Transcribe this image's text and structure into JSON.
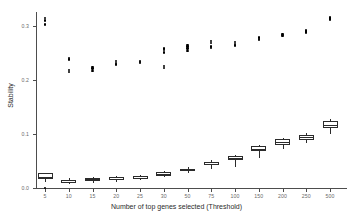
{
  "chart_data": {
    "type": "box",
    "title": "",
    "xlabel": "Number of top genes selected (Threshold)",
    "ylabel": "Stability",
    "grid": false,
    "legend": "none",
    "categories": [
      "5",
      "10",
      "15",
      "20",
      "25",
      "30",
      "50",
      "75",
      "100",
      "150",
      "200",
      "250",
      "500"
    ],
    "ylim": [
      0.0,
      0.33
    ],
    "yticks": [
      0.0,
      0.1,
      0.2,
      0.3
    ],
    "ytick_labels": [
      "0.0",
      "0.1",
      "0.2",
      "0.3"
    ],
    "series": [
      {
        "name": "lower-boxplots",
        "boxes": [
          {
            "category": "5",
            "whisker_low": 0.012,
            "q1": 0.016,
            "median": 0.021,
            "q3": 0.027,
            "whisker_high": 0.027,
            "outliers": [
              0.0
            ]
          },
          {
            "category": "10",
            "whisker_low": 0.008,
            "q1": 0.01,
            "median": 0.012,
            "q3": 0.015,
            "whisker_high": 0.018,
            "outliers": []
          },
          {
            "category": "15",
            "whisker_low": 0.01,
            "q1": 0.013,
            "median": 0.016,
            "q3": 0.019,
            "whisker_high": 0.021,
            "outliers": []
          },
          {
            "category": "20",
            "whisker_low": 0.012,
            "q1": 0.015,
            "median": 0.017,
            "q3": 0.02,
            "whisker_high": 0.022,
            "outliers": []
          },
          {
            "category": "25",
            "whisker_low": 0.014,
            "q1": 0.017,
            "median": 0.019,
            "q3": 0.023,
            "whisker_high": 0.025,
            "outliers": []
          },
          {
            "category": "30",
            "whisker_low": 0.02,
            "q1": 0.023,
            "median": 0.026,
            "q3": 0.029,
            "whisker_high": 0.031,
            "outliers": []
          },
          {
            "category": "50",
            "whisker_low": 0.028,
            "q1": 0.031,
            "median": 0.033,
            "q3": 0.036,
            "whisker_high": 0.038,
            "outliers": []
          },
          {
            "category": "75",
            "whisker_low": 0.036,
            "q1": 0.042,
            "median": 0.045,
            "q3": 0.048,
            "whisker_high": 0.051,
            "outliers": []
          },
          {
            "category": "100",
            "whisker_low": 0.038,
            "q1": 0.052,
            "median": 0.055,
            "q3": 0.059,
            "whisker_high": 0.061,
            "outliers": []
          },
          {
            "category": "150",
            "whisker_low": 0.055,
            "q1": 0.068,
            "median": 0.073,
            "q3": 0.077,
            "whisker_high": 0.079,
            "outliers": []
          },
          {
            "category": "200",
            "whisker_low": 0.073,
            "q1": 0.08,
            "median": 0.085,
            "q3": 0.09,
            "whisker_high": 0.092,
            "outliers": []
          },
          {
            "category": "250",
            "whisker_low": 0.084,
            "q1": 0.089,
            "median": 0.094,
            "q3": 0.099,
            "whisker_high": 0.101,
            "outliers": []
          },
          {
            "category": "500",
            "whisker_low": 0.1,
            "q1": 0.111,
            "median": 0.116,
            "q3": 0.124,
            "whisker_high": 0.127,
            "outliers": []
          }
        ]
      },
      {
        "name": "upper-points",
        "points": [
          {
            "category": "5",
            "values": [
              0.315,
              0.31,
              0.303
            ]
          },
          {
            "category": "10",
            "values": [
              0.241,
              0.238,
              0.219,
              0.215
            ]
          },
          {
            "category": "15",
            "values": [
              0.224,
              0.221,
              0.217
            ]
          },
          {
            "category": "20",
            "values": [
              0.235,
              0.232,
              0.229
            ]
          },
          {
            "category": "25",
            "values": [
              0.235,
              0.233,
              0.231
            ]
          },
          {
            "category": "30",
            "values": [
              0.258,
              0.255,
              0.251,
              0.226,
              0.222
            ]
          },
          {
            "category": "50",
            "values": [
              0.265,
              0.262,
              0.258,
              0.254
            ]
          },
          {
            "category": "75",
            "values": [
              0.272,
              0.269,
              0.262,
              0.259
            ]
          },
          {
            "category": "100",
            "values": [
              0.27,
              0.267,
              0.264
            ]
          },
          {
            "category": "150",
            "values": [
              0.279,
              0.276,
              0.274
            ]
          },
          {
            "category": "200",
            "values": [
              0.285,
              0.283,
              0.281
            ]
          },
          {
            "category": "250",
            "values": [
              0.292,
              0.29,
              0.288
            ]
          },
          {
            "category": "500",
            "values": [
              0.316,
              0.314,
              0.312
            ]
          }
        ]
      }
    ]
  }
}
